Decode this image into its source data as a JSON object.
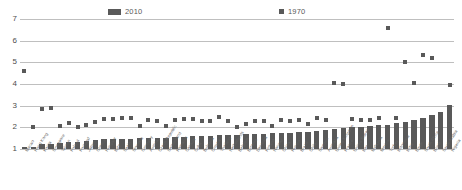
{
  "legend": {
    "entries": [
      {
        "label": "2010",
        "marker": "bar-swatch",
        "color": "#595959"
      },
      {
        "label": "1970",
        "marker": "square-dot",
        "color": "#595959"
      }
    ]
  },
  "axes": {
    "y_ticks": [
      "7",
      "6",
      "5",
      "4",
      "3",
      "2",
      "1"
    ],
    "y_min": 1,
    "y_max": 7
  },
  "chart_data": {
    "type": "bar",
    "title": "",
    "subtitle": "",
    "xlabel": "",
    "ylabel": "",
    "ylim": [
      1,
      7
    ],
    "grid": true,
    "legend_position": "top",
    "categories": [
      "Macao",
      "Hong Kong",
      "Korea",
      "Singapore",
      "Taiwan",
      "Poland",
      "Portugal",
      "Japan",
      "Greece",
      "Hungary",
      "Italy",
      "Spain",
      "Slovakia",
      "Germany",
      "Austria",
      "Czech Republic",
      "Switzerland",
      "Romania",
      "Canada",
      "Cuba",
      "Bulgaria",
      "Croatia",
      "Thailand",
      "Netherlands",
      "Belgium",
      "Estonia",
      "Denmark",
      "Finland",
      "Norway",
      "China",
      "Russia",
      "Brazil",
      "Chile",
      "Sweden",
      "Australia",
      "United Kingdom",
      "France",
      "United States",
      "Iran",
      "Malaysia",
      "Mexico",
      "Turkey",
      "Indonesia",
      "India",
      "Egypt",
      "South Africa",
      "Israel",
      "Saudi Arabia",
      "Nigeria"
    ],
    "series": [
      {
        "name": "2010",
        "type": "bar",
        "color": "#595959",
        "values": [
          1.07,
          1.11,
          1.23,
          1.25,
          1.28,
          1.31,
          1.34,
          1.39,
          1.42,
          1.44,
          1.46,
          1.47,
          1.48,
          1.5,
          1.51,
          1.52,
          1.53,
          1.55,
          1.57,
          1.58,
          1.6,
          1.61,
          1.63,
          1.65,
          1.66,
          1.68,
          1.69,
          1.71,
          1.72,
          1.74,
          1.75,
          1.77,
          1.8,
          1.84,
          1.88,
          1.92,
          1.96,
          2.0,
          2.02,
          2.05,
          2.09,
          2.12,
          2.18,
          2.26,
          2.35,
          2.42,
          2.55,
          2.72,
          3.05
        ]
      },
      {
        "name": "1970",
        "type": "scatter",
        "color": "#595959",
        "values": [
          4.6,
          2.0,
          2.85,
          2.9,
          2.06,
          2.22,
          2.0,
          2.12,
          2.25,
          2.4,
          2.39,
          2.45,
          2.43,
          2.04,
          2.32,
          2.27,
          2.05,
          2.36,
          2.4,
          2.39,
          2.27,
          2.28,
          2.47,
          2.3,
          2.02,
          2.14,
          2.3,
          2.28,
          2.05,
          2.33,
          2.3,
          2.35,
          2.14,
          2.41,
          2.36,
          4.05,
          4.02,
          2.4,
          2.36,
          2.35,
          2.42,
          6.6,
          2.45,
          5.0,
          4.05,
          5.35,
          5.2,
          2.4,
          3.95
        ]
      }
    ]
  }
}
